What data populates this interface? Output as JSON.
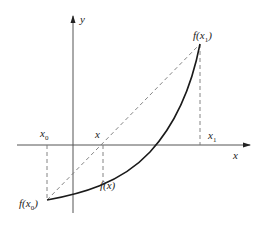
{
  "diagram": {
    "type": "secant-method-illustration",
    "axes": {
      "x_label": "x",
      "y_label": "y"
    },
    "labels": {
      "x0": {
        "base": "x",
        "sub": "0"
      },
      "x": {
        "base": "x"
      },
      "x1": {
        "base": "x",
        "sub": "1"
      },
      "f_x0": {
        "prefix": "f(",
        "base": "x",
        "sub": "0",
        "suffix": ")"
      },
      "f_x": {
        "text": "f(x)"
      },
      "f_x1": {
        "prefix": "f(",
        "base": "x",
        "sub": "1",
        "suffix": ")"
      }
    },
    "elements": [
      "x-axis with arrow",
      "y-axis with arrow",
      "convex increasing curve from f(x0) to f(x1)",
      "dashed secant line from (x0, f(x0)) to (x1, f(x1))",
      "dashed vertical line from x0 to f(x0)",
      "dashed vertical line from x to f(x)",
      "dashed vertical line from x1 to f(x1)"
    ],
    "colors": {
      "axis": "#555555",
      "curve": "#1a1a1a",
      "dashed": "#777777"
    }
  }
}
